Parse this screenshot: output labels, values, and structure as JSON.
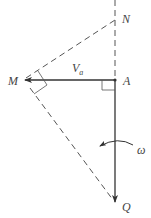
{
  "diagram": {
    "type": "kinematics-velocity-diagram",
    "colors": {
      "line": "#333333",
      "dashed": "#555555",
      "label": "#444444",
      "background": "#ffffff"
    },
    "points": {
      "N": {
        "label": "N"
      },
      "A": {
        "label": "A"
      },
      "M": {
        "label": "M"
      },
      "Q": {
        "label": "Q"
      }
    },
    "velocity": {
      "symbol": "V",
      "subscript": "a"
    },
    "angular_velocity": {
      "label": "ω"
    }
  }
}
